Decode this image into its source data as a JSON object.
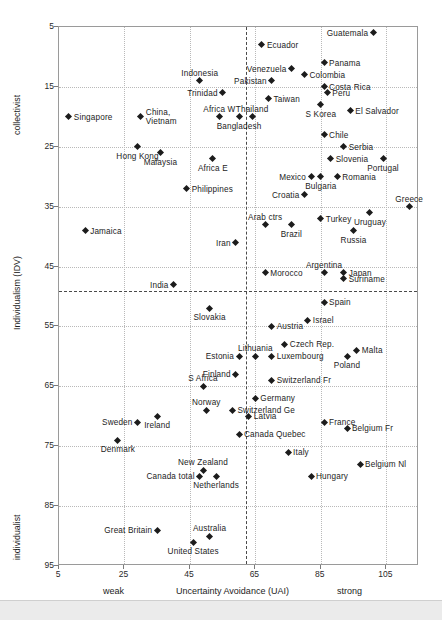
{
  "chart_data": {
    "type": "scatter",
    "title": "",
    "xlabel": "Uncertainty Avoidance (UAI)",
    "ylabel": "Individualism (IDV)",
    "xlim": [
      5,
      115
    ],
    "ylim": [
      5,
      95
    ],
    "y_inverted": true,
    "grid": true,
    "legend": null,
    "xticks": [
      5,
      25,
      45,
      65,
      85,
      105
    ],
    "yticks": [
      5,
      15,
      25,
      35,
      45,
      55,
      65,
      75,
      85,
      95
    ],
    "x_axis_low_label": "weak",
    "x_axis_high_label": "strong",
    "y_axis_low_label": "collectivist",
    "y_axis_high_label": "individualist",
    "mean_line_x": 62,
    "mean_line_y": 49,
    "points": [
      {
        "name": "Guatemala",
        "x": 101,
        "y": 6,
        "pos": "r"
      },
      {
        "name": "Ecuador",
        "x": 67,
        "y": 8,
        "pos": "l"
      },
      {
        "name": "Panama",
        "x": 86,
        "y": 11,
        "pos": "l"
      },
      {
        "name": "Venezuela",
        "x": 76,
        "y": 12,
        "pos": "r"
      },
      {
        "name": "Colombia",
        "x": 80,
        "y": 13,
        "pos": "l"
      },
      {
        "name": "Indonesia",
        "x": 48,
        "y": 14,
        "pos": "t"
      },
      {
        "name": "Pakistan",
        "x": 70,
        "y": 14,
        "pos": "r"
      },
      {
        "name": "Costa Rica",
        "x": 86,
        "y": 15,
        "pos": "l"
      },
      {
        "name": "Peru",
        "x": 87,
        "y": 16,
        "pos": "l"
      },
      {
        "name": "Trinidad",
        "x": 55,
        "y": 16,
        "pos": "r"
      },
      {
        "name": "Taiwan",
        "x": 69,
        "y": 17,
        "pos": "l"
      },
      {
        "name": "Africa W",
        "x": 54,
        "y": 20,
        "pos": "t"
      },
      {
        "name": "Thailand",
        "x": 64,
        "y": 20,
        "pos": "t"
      },
      {
        "name": "S Korea",
        "x": 85,
        "y": 18,
        "pos": "b"
      },
      {
        "name": "El Salvador",
        "x": 94,
        "y": 19,
        "pos": "l"
      },
      {
        "name": "Singapore",
        "x": 8,
        "y": 20,
        "pos": "l"
      },
      {
        "name": "China, Vietnam",
        "x": 30,
        "y": 20,
        "pos": "l"
      },
      {
        "name": "Bangladesh",
        "x": 60,
        "y": 20,
        "pos": "b"
      },
      {
        "name": "Hong Kong",
        "x": 29,
        "y": 25,
        "pos": "b"
      },
      {
        "name": "Chile",
        "x": 86,
        "y": 23,
        "pos": "l"
      },
      {
        "name": "Serbia",
        "x": 92,
        "y": 25,
        "pos": "l"
      },
      {
        "name": "Slovenia",
        "x": 88,
        "y": 27,
        "pos": "l"
      },
      {
        "name": "Portugal",
        "x": 104,
        "y": 27,
        "pos": "b"
      },
      {
        "name": "Malaysia",
        "x": 36,
        "y": 26,
        "pos": "b"
      },
      {
        "name": "Mexico",
        "x": 82,
        "y": 30,
        "pos": "r"
      },
      {
        "name": "Bulgaria",
        "x": 85,
        "y": 30,
        "pos": "b"
      },
      {
        "name": "Romania",
        "x": 90,
        "y": 30,
        "pos": "l"
      },
      {
        "name": "Africa E",
        "x": 52,
        "y": 27,
        "pos": "b"
      },
      {
        "name": "Croatia",
        "x": 80,
        "y": 33,
        "pos": "r"
      },
      {
        "name": "Philippines",
        "x": 44,
        "y": 32,
        "pos": "l"
      },
      {
        "name": "Greece",
        "x": 112,
        "y": 35,
        "pos": "t"
      },
      {
        "name": "Uruguay",
        "x": 100,
        "y": 36,
        "pos": "b"
      },
      {
        "name": "Turkey",
        "x": 85,
        "y": 37,
        "pos": "l"
      },
      {
        "name": "Arab ctrs",
        "x": 68,
        "y": 38,
        "pos": "t"
      },
      {
        "name": "Brazil",
        "x": 76,
        "y": 38,
        "pos": "b"
      },
      {
        "name": "Russia",
        "x": 95,
        "y": 39,
        "pos": "b"
      },
      {
        "name": "Jamaica",
        "x": 13,
        "y": 39,
        "pos": "l"
      },
      {
        "name": "Iran",
        "x": 59,
        "y": 41,
        "pos": "r"
      },
      {
        "name": "Argentina",
        "x": 86,
        "y": 46,
        "pos": "t"
      },
      {
        "name": "Morocco",
        "x": 68,
        "y": 46,
        "pos": "l"
      },
      {
        "name": "Japan",
        "x": 92,
        "y": 46,
        "pos": "l"
      },
      {
        "name": "Suriname",
        "x": 92,
        "y": 47,
        "pos": "l"
      },
      {
        "name": "India",
        "x": 40,
        "y": 48,
        "pos": "r"
      },
      {
        "name": "Spain",
        "x": 86,
        "y": 51,
        "pos": "l"
      },
      {
        "name": "Slovakia",
        "x": 51,
        "y": 52,
        "pos": "b"
      },
      {
        "name": "Israel",
        "x": 81,
        "y": 54,
        "pos": "l"
      },
      {
        "name": "Austria",
        "x": 70,
        "y": 55,
        "pos": "l"
      },
      {
        "name": "Czech Rep.",
        "x": 74,
        "y": 58,
        "pos": "l"
      },
      {
        "name": "Lithuania",
        "x": 65,
        "y": 60,
        "pos": "t"
      },
      {
        "name": "Estonia",
        "x": 60,
        "y": 60,
        "pos": "r"
      },
      {
        "name": "Luxembourg",
        "x": 70,
        "y": 60,
        "pos": "l"
      },
      {
        "name": "Malta",
        "x": 96,
        "y": 59,
        "pos": "l"
      },
      {
        "name": "Poland",
        "x": 93,
        "y": 60,
        "pos": "b"
      },
      {
        "name": "Finland",
        "x": 59,
        "y": 63,
        "pos": "r"
      },
      {
        "name": "Switzerland Fr",
        "x": 70,
        "y": 64,
        "pos": "l"
      },
      {
        "name": "S Africa",
        "x": 49,
        "y": 65,
        "pos": "t"
      },
      {
        "name": "Germany",
        "x": 65,
        "y": 67,
        "pos": "l"
      },
      {
        "name": "Switzerland Ge",
        "x": 58,
        "y": 69,
        "pos": "l"
      },
      {
        "name": "Latvia",
        "x": 63,
        "y": 70,
        "pos": "l"
      },
      {
        "name": "Norway",
        "x": 50,
        "y": 69,
        "pos": "t"
      },
      {
        "name": "Sweden",
        "x": 29,
        "y": 71,
        "pos": "r"
      },
      {
        "name": "Ireland",
        "x": 35,
        "y": 70,
        "pos": "b"
      },
      {
        "name": "France",
        "x": 86,
        "y": 71,
        "pos": "l"
      },
      {
        "name": "Canada Quebec",
        "x": 60,
        "y": 73,
        "pos": "l"
      },
      {
        "name": "Belgium Fr",
        "x": 93,
        "y": 72,
        "pos": "l"
      },
      {
        "name": "Denmark",
        "x": 23,
        "y": 74,
        "pos": "b"
      },
      {
        "name": "Italy",
        "x": 75,
        "y": 76,
        "pos": "l"
      },
      {
        "name": "New Zealand",
        "x": 49,
        "y": 79,
        "pos": "t"
      },
      {
        "name": "Canada total",
        "x": 48,
        "y": 80,
        "pos": "r"
      },
      {
        "name": "Netherlands",
        "x": 53,
        "y": 80,
        "pos": "b"
      },
      {
        "name": "Belgium Nl",
        "x": 97,
        "y": 78,
        "pos": "l"
      },
      {
        "name": "Hungary",
        "x": 82,
        "y": 80,
        "pos": "l"
      },
      {
        "name": "Great Britain",
        "x": 35,
        "y": 89,
        "pos": "r"
      },
      {
        "name": "Australia",
        "x": 51,
        "y": 90,
        "pos": "t"
      },
      {
        "name": "United States",
        "x": 46,
        "y": 91,
        "pos": "b"
      }
    ]
  }
}
